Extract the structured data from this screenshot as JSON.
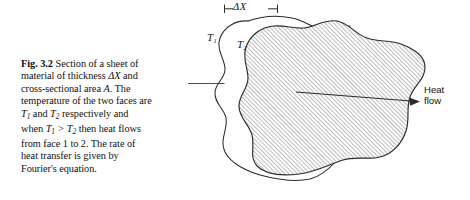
{
  "figure": {
    "number": "Fig. 3.2",
    "caption_lines": [
      "Fig. 3.2 Section of a sheet of",
      "material of thickness ΔX and",
      "cross-sectional area A. The",
      "temperature of the two faces are",
      "T1 and T2 respectively and",
      "when T1 > T2 then heat flows",
      "from face 1 to 2. The rate of",
      "heat transfer is given by",
      "Fourier's equation."
    ],
    "caption_full": "Fig. 3.2 Section of a sheet of material of thickness ΔX and cross-sectional area A. The temperature of the two faces are T1 and T2 respectively and when T1 > T2 then heat flows from face 1 to 2. The rate of heat transfer is given by Fourier's equation."
  },
  "caption_tokens": {
    "fig_label": "Fig. 3.2",
    "l1_rest": "Section of a sheet of",
    "l2_a": "material of thickness ",
    "l2_delta": "ΔX",
    "l2_b": " and",
    "l3_a": "cross-sectional area ",
    "l3_area": "A",
    "l3_b": ". The",
    "l4": "temperature of the two faces are",
    "l5_t": "T",
    "l5_sub": "1",
    "l5_a": " and ",
    "l5_t2": "T",
    "l5_sub2": "2",
    "l5_b": " respectively and",
    "l6_pre": "when ",
    "l6_t1": "T",
    "l6_s1": "1",
    "l6_gt": ">",
    "l6_t2": "T",
    "l6_s2": "2",
    "l6_post": " then heat flows",
    "l7": "from face 1 to 2. The rate of",
    "l8": "heat transfer is given by",
    "l9": "Fourier's equation."
  },
  "diagram": {
    "thickness_label": "—Δ X—",
    "thickness_symbol": "ΔX",
    "front_face_label": "T₁",
    "front_face_symbol": "T",
    "front_face_subscript": "1",
    "back_face_label": "T₂",
    "back_face_symbol": "T",
    "back_face_subscript": "2",
    "heat_flow_line1": "Heat",
    "heat_flow_line2": "flow",
    "heat_flow_label": "Heat flow",
    "shape_description": "irregular blob cross-section, hatched rear face offset behind outlined front face"
  },
  "colors": {
    "background": "#ffffff",
    "ink": "#111111",
    "outline": "#2b2b2b",
    "hatch": "#8d8d8d",
    "hatch_fill": "#fdfdfd",
    "leader": "#3a3a3a"
  }
}
